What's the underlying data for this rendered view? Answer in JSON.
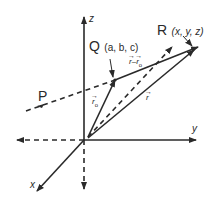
{
  "diagram": {
    "type": "3d-vector-line-diagram",
    "axes": {
      "x_label": "x",
      "y_label": "y",
      "z_label": "z"
    },
    "points": {
      "Q": {
        "name": "Q",
        "coords": "(a, b, c)"
      },
      "R": {
        "name": "R",
        "coords": "(x, y, z)"
      },
      "P": {
        "name": "P"
      }
    },
    "vectors": {
      "r0": {
        "label": "r",
        "subscript": "o"
      },
      "r": {
        "label": "r"
      },
      "r_minus_r0": {
        "label_a": "r",
        "minus": "–",
        "label_b": "r",
        "subscript": "o"
      }
    },
    "colors": {
      "ink": "#2a2a2a",
      "background": "#ffffff"
    }
  }
}
